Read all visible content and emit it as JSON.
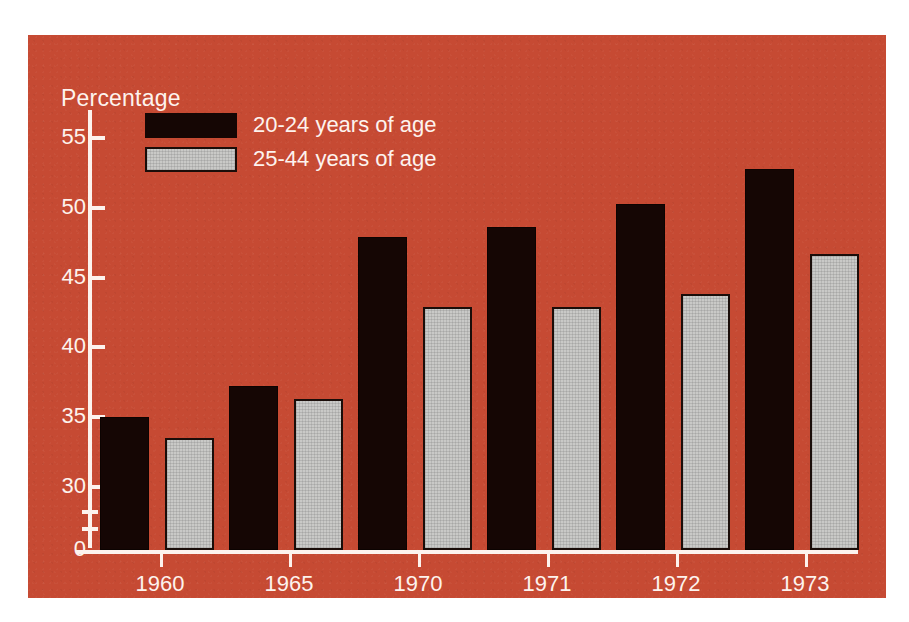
{
  "chart_data": {
    "type": "bar",
    "title": "",
    "ylabel": "Percentage",
    "xlabel": "",
    "categories": [
      "1960",
      "1965",
      "1970",
      "1971",
      "1972",
      "1973"
    ],
    "series": [
      {
        "name": "20-24 years of age",
        "color": "#150604",
        "values": [
          35.0,
          37.2,
          47.9,
          48.6,
          50.3,
          52.8
        ]
      },
      {
        "name": "25-44 years of age",
        "color": "#c9c9c7",
        "values": [
          33.5,
          36.3,
          42.9,
          42.9,
          43.8,
          46.7
        ]
      }
    ],
    "ytick_labels": [
      "0",
      "30",
      "35",
      "40",
      "45",
      "50",
      "55"
    ],
    "ylim": [
      30,
      57
    ],
    "axis_break": true,
    "grid": false,
    "legend_position": "top-left",
    "background_color": "#c64a33",
    "axis_color": "#fdf3ee"
  },
  "axis": {
    "y_title": "Percentage",
    "ticks": [
      {
        "label": "55",
        "value": 55
      },
      {
        "label": "50",
        "value": 50
      },
      {
        "label": "45",
        "value": 45
      },
      {
        "label": "40",
        "value": 40
      },
      {
        "label": "35",
        "value": 35
      },
      {
        "label": "30",
        "value": 30
      },
      {
        "label": "0",
        "value": 0
      }
    ]
  },
  "legend": {
    "items": [
      {
        "label": "20-24 years of age",
        "swatch": "dark"
      },
      {
        "label": "25-44 years of age",
        "swatch": "light"
      }
    ]
  }
}
